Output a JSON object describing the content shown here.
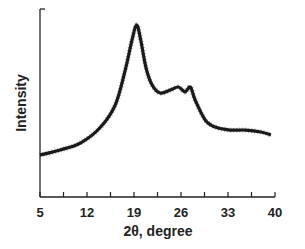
{
  "chart_data": {
    "type": "line",
    "title": "",
    "xlabel": "2θ, degree",
    "ylabel": "Intensity",
    "xlim": [
      5,
      40
    ],
    "ylim": [
      0,
      100
    ],
    "grid": false,
    "legend": null,
    "x_ticks": [
      5,
      12,
      19,
      26,
      33,
      40
    ],
    "x_tick_labels": [
      "5",
      "12",
      "19",
      "26",
      "33",
      "40"
    ],
    "y_ticks": [],
    "series": [
      {
        "name": "XRD pattern",
        "color": "#1a1a1a",
        "x": [
          5.0,
          8.0,
          11.0,
          13.9,
          16.2,
          17.7,
          18.7,
          19.4,
          20.0,
          20.8,
          21.7,
          22.9,
          24.4,
          25.6,
          26.6,
          27.4,
          28.1,
          29.6,
          31.1,
          33.3,
          35.6,
          37.9,
          39.4
        ],
        "values": [
          22.3,
          25.0,
          28.7,
          36.7,
          48.9,
          67.6,
          83.5,
          91.5,
          83.5,
          68.6,
          59.6,
          55.3,
          56.9,
          58.5,
          55.9,
          58.5,
          51.6,
          41.0,
          37.2,
          35.6,
          35.6,
          34.6,
          33.0
        ]
      }
    ]
  }
}
